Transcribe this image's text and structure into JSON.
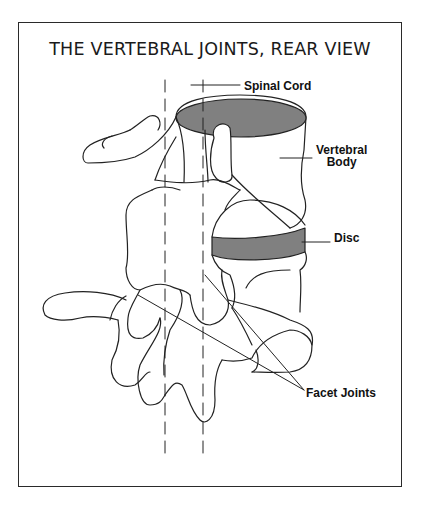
{
  "diagram": {
    "title": "THE VERTEBRAL JOINTS, REAR VIEW",
    "labels": {
      "spinal_cord": "Spinal Cord",
      "vertebral_body_line1": "Vertebral",
      "vertebral_body_line2": "Body",
      "disc": "Disc",
      "facet_joints": "Facet Joints"
    },
    "colors": {
      "line": "#222222",
      "disc_fill": "#808080",
      "background": "#ffffff"
    }
  }
}
